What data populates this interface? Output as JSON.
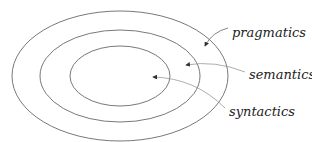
{
  "diagram": {
    "type": "nested-ellipses",
    "rings": [
      {
        "name": "pragmatics",
        "level": "outer"
      },
      {
        "name": "semantics",
        "level": "middle"
      },
      {
        "name": "syntactics",
        "level": "inner"
      }
    ],
    "labels": {
      "pragmatics": "pragmatics",
      "semantics": "semantics",
      "syntactics": "syntactics"
    },
    "colors": {
      "line": "#555555",
      "arrow": "#999999",
      "text": "#222222"
    }
  }
}
